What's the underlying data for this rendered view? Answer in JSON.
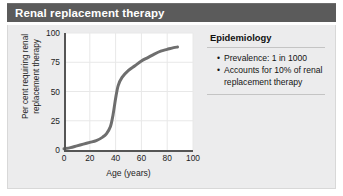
{
  "header": {
    "title": "Renal replacement therapy",
    "background_color": "#5b5b5b",
    "text_color": "#ffffff"
  },
  "card": {
    "background_color": "#ececed",
    "border_color": "#d8d8d8"
  },
  "info_panel": {
    "heading": "Epidemiology",
    "bullet_glyph": "•",
    "items": [
      "Prevalence: 1 in 1000",
      "Accounts for 10% of renal replacement therapy"
    ]
  },
  "chart_data": {
    "type": "line",
    "title": "",
    "xlabel": "Age (years)",
    "ylabel": "Per cent requiring renal replacement therapy",
    "xlim": [
      0,
      100
    ],
    "ylim": [
      0,
      100
    ],
    "xticks": [
      0,
      20,
      40,
      60,
      80,
      100
    ],
    "yticks": [
      0,
      25,
      50,
      75,
      100
    ],
    "xtick_labels": [
      "0",
      "20",
      "40",
      "60",
      "80",
      "100"
    ],
    "ytick_labels": [
      "0",
      "25",
      "50",
      "75",
      "100"
    ],
    "grid": true,
    "grid_color": "#e8e8e8",
    "legend": false,
    "line_color": "#6e6e6e",
    "line_width": 3,
    "series": [
      {
        "name": "Per cent requiring renal replacement therapy",
        "x": [
          0,
          5,
          10,
          15,
          20,
          25,
          30,
          33,
          36,
          38,
          40,
          42,
          45,
          50,
          55,
          60,
          65,
          70,
          75,
          80,
          85,
          88
        ],
        "y": [
          1,
          2,
          3.5,
          5,
          6.5,
          8,
          11,
          14,
          20,
          30,
          44,
          55,
          62,
          68,
          72,
          76,
          79,
          82,
          84.5,
          86,
          87.5,
          88
        ]
      }
    ]
  }
}
